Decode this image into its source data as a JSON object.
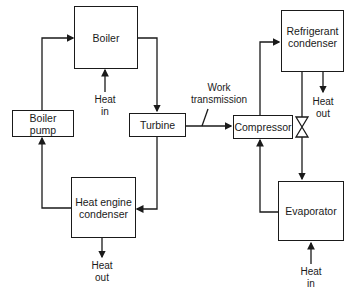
{
  "diagram": {
    "components": {
      "boiler": "Boiler",
      "boiler_pump_l1": "Boiler",
      "boiler_pump_l2": "pump",
      "turbine": "Turbine",
      "he_condenser_l1": "Heat engine",
      "he_condenser_l2": "condenser",
      "compressor": "Compressor",
      "ref_condenser_l1": "Refrigerant",
      "ref_condenser_l2": "condenser",
      "evaporator": "Evaporator"
    },
    "labels": {
      "boiler_heat_l1": "Heat",
      "boiler_heat_l2": "in",
      "he_cond_heat_l1": "Heat",
      "he_cond_heat_l2": "out",
      "ref_cond_heat_l1": "Heat",
      "ref_cond_heat_l2": "out",
      "evap_heat_l1": "Heat",
      "evap_heat_l2": "in",
      "work_l1": "Work",
      "work_l2": "transmission"
    },
    "colors": {
      "line": "#1a1a1a",
      "background": "#ffffff"
    }
  }
}
